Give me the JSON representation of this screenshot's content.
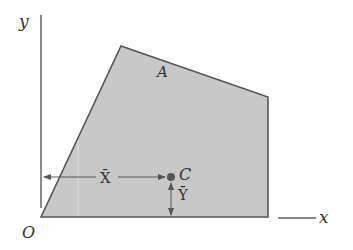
{
  "diagram": {
    "title": "",
    "colors": {
      "region_fill": "#c8c8c8",
      "region_stroke": "#555555",
      "axis": "#666666",
      "text": "#333333",
      "centroid": "#555555",
      "arrow": "#555555"
    },
    "labels": {
      "y_axis": "y",
      "x_axis": "x",
      "origin": "O",
      "area": "A",
      "centroid": "C",
      "x_bar": "X̄",
      "y_bar": "Ȳ"
    },
    "region": {
      "points": [
        [
          41,
          217
        ],
        [
          121,
          46
        ],
        [
          268,
          97
        ],
        [
          268,
          217
        ]
      ]
    },
    "centroid": {
      "x": 171,
      "y": 177
    }
  }
}
